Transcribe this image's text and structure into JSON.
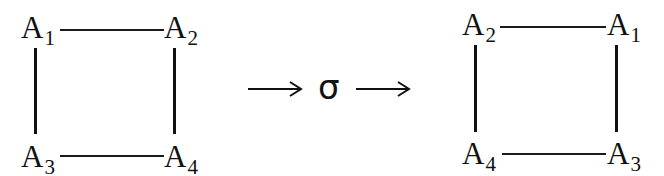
{
  "diagram": {
    "left": {
      "top_left": {
        "base": "A",
        "sub": "1"
      },
      "top_right": {
        "base": "A",
        "sub": "2"
      },
      "bottom_left": {
        "base": "A",
        "sub": "3"
      },
      "bottom_right": {
        "base": "A",
        "sub": "4"
      }
    },
    "mapping": {
      "symbol": "σ"
    },
    "right": {
      "top_left": {
        "base": "A",
        "sub": "2"
      },
      "top_right": {
        "base": "A",
        "sub": "1"
      },
      "bottom_left": {
        "base": "A",
        "sub": "4"
      },
      "bottom_right": {
        "base": "A",
        "sub": "3"
      }
    },
    "colors": {
      "ink": "#111111",
      "background": "#ffffff"
    }
  }
}
